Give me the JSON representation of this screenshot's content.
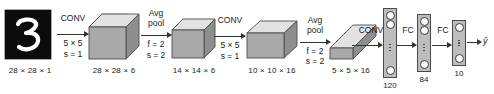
{
  "diagram": {
    "input": {
      "name": "input-image",
      "digit": "3",
      "dim_label": "28 × 28 × 1",
      "background_color": "#0b0b0b",
      "stroke_color": "#ffffff"
    },
    "ops": [
      {
        "id": "conv1",
        "label": "CONV",
        "param1": "5 × 5",
        "param2": "s = 1"
      },
      {
        "id": "pool1",
        "label_line1": "Avg",
        "label_line2": "pool",
        "param1": "f = 2",
        "param2": "s = 2"
      },
      {
        "id": "conv2",
        "label": "CONV",
        "param1": "5 × 5",
        "param2": "s = 1"
      },
      {
        "id": "pool2",
        "label_line1": "Avg",
        "label_line2": "pool",
        "param1": "f = 2",
        "param2": "s = 2"
      },
      {
        "id": "conv3",
        "label": "CONV"
      },
      {
        "id": "fc1",
        "label": "FC"
      },
      {
        "id": "fc2",
        "label": "FC"
      }
    ],
    "volumes": [
      {
        "id": "vol-28x28x6",
        "dim_label": "28 × 28 × 6"
      },
      {
        "id": "vol-14x14x6",
        "dim_label": "14 × 14 × 6"
      },
      {
        "id": "vol-10x10x16",
        "dim_label": "10 × 10 × 16"
      },
      {
        "id": "vol-5x5x16",
        "dim_label": "5 × 5 × 16"
      }
    ],
    "fc_layers": [
      {
        "id": "fc-120",
        "units_label": "120"
      },
      {
        "id": "fc-84",
        "units_label": "84"
      },
      {
        "id": "fc-10",
        "units_label": "10"
      }
    ],
    "output": {
      "label": "ŷ"
    },
    "colors": {
      "box_front": "#a9a9a9",
      "box_top": "#e2e2e2",
      "box_side": "#8e8e8e",
      "outline": "#4d4d4d",
      "text": "#1a1a1a",
      "background": "#ffffff"
    }
  }
}
